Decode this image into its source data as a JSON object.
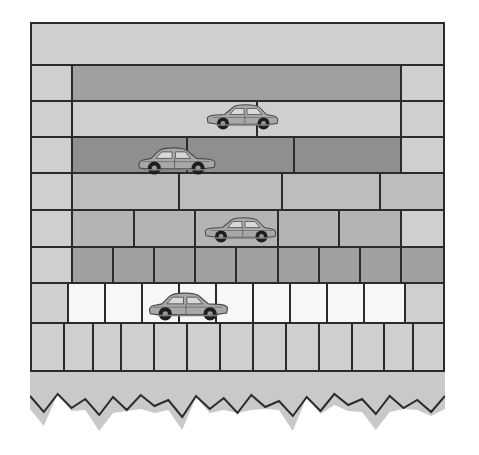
{
  "figure": {
    "kind": "diagram",
    "frame": {
      "border_color": "#2b2b2b",
      "background_color": "#c9c9c9",
      "x": 30,
      "y": 22,
      "width": 415,
      "height": 350
    }
  },
  "palette": {
    "outline": "#2b2b2b",
    "lightest": "#f7f7f7",
    "light": "#cfcfcf",
    "mid": "#bdbdbd",
    "mid2": "#b4b4b4",
    "dark": "#a0a0a0",
    "darker": "#8f8f8f",
    "rubble_fill": "#c9c9c9",
    "car_body": "#a8a8a8",
    "car_wheel": "#222222"
  },
  "wall": {
    "description": "Nine horizontal courses of masonry; brick count increases downward while brick size decreases.",
    "rows": [
      {
        "index": 1,
        "name": "course-1-capping",
        "height_px": 42,
        "tone": "light",
        "brick_count": 1,
        "bricks": [
          {
            "width_pct": 100,
            "tone": "light"
          }
        ]
      },
      {
        "index": 2,
        "name": "course-2",
        "height_px": 36,
        "tone": "dark",
        "brick_count": 3,
        "bricks": [
          {
            "width_pct": 10,
            "tone": "light"
          },
          {
            "width_pct": 80,
            "tone": "dark"
          },
          {
            "width_pct": 10,
            "tone": "light"
          }
        ]
      },
      {
        "index": 3,
        "name": "course-3",
        "height_px": 36,
        "tone": "light",
        "brick_count": 4,
        "bricks": [
          {
            "width_pct": 10,
            "tone": "light"
          },
          {
            "width_pct": 45,
            "tone": "light"
          },
          {
            "width_pct": 35,
            "tone": "light"
          },
          {
            "width_pct": 10,
            "tone": "light"
          }
        ]
      },
      {
        "index": 4,
        "name": "course-4",
        "height_px": 36,
        "tone": "darker",
        "brick_count": 5,
        "bricks": [
          {
            "width_pct": 10,
            "tone": "light"
          },
          {
            "width_pct": 28,
            "tone": "darker"
          },
          {
            "width_pct": 26,
            "tone": "darker"
          },
          {
            "width_pct": 26,
            "tone": "darker"
          },
          {
            "width_pct": 10,
            "tone": "light"
          }
        ]
      },
      {
        "index": 5,
        "name": "course-5",
        "height_px": 37,
        "tone": "mid",
        "brick_count": 5,
        "bricks": [
          {
            "width_pct": 10,
            "tone": "light"
          },
          {
            "width_pct": 26,
            "tone": "mid"
          },
          {
            "width_pct": 25,
            "tone": "mid"
          },
          {
            "width_pct": 24,
            "tone": "mid"
          },
          {
            "width_pct": 15,
            "tone": "mid"
          }
        ]
      },
      {
        "index": 6,
        "name": "course-6",
        "height_px": 37,
        "tone": "mid2",
        "brick_count": 7,
        "bricks": [
          {
            "width_pct": 10,
            "tone": "light"
          },
          {
            "width_pct": 15,
            "tone": "mid2"
          },
          {
            "width_pct": 15,
            "tone": "mid2"
          },
          {
            "width_pct": 20,
            "tone": "mid2"
          },
          {
            "width_pct": 15,
            "tone": "mid2"
          },
          {
            "width_pct": 15,
            "tone": "mid2"
          },
          {
            "width_pct": 10,
            "tone": "light"
          }
        ]
      },
      {
        "index": 7,
        "name": "course-7",
        "height_px": 36,
        "tone": "dark",
        "brick_count": 10,
        "bricks": [
          {
            "width_pct": 10,
            "tone": "light"
          },
          {
            "width_pct": 10,
            "tone": "dark"
          },
          {
            "width_pct": 10,
            "tone": "dark"
          },
          {
            "width_pct": 10,
            "tone": "dark"
          },
          {
            "width_pct": 10,
            "tone": "dark"
          },
          {
            "width_pct": 10,
            "tone": "dark"
          },
          {
            "width_pct": 10,
            "tone": "dark"
          },
          {
            "width_pct": 10,
            "tone": "dark"
          },
          {
            "width_pct": 10,
            "tone": "dark"
          },
          {
            "width_pct": 10,
            "tone": "dark"
          }
        ]
      },
      {
        "index": 8,
        "name": "course-8-white",
        "height_px": 40,
        "tone": "lightest",
        "brick_count": 11,
        "bricks": [
          {
            "width_pct": 9,
            "tone": "light"
          },
          {
            "width_pct": 9,
            "tone": "lightest"
          },
          {
            "width_pct": 9,
            "tone": "lightest"
          },
          {
            "width_pct": 9,
            "tone": "lightest"
          },
          {
            "width_pct": 9,
            "tone": "lightest"
          },
          {
            "width_pct": 9,
            "tone": "lightest"
          },
          {
            "width_pct": 9,
            "tone": "lightest"
          },
          {
            "width_pct": 9,
            "tone": "lightest"
          },
          {
            "width_pct": 9,
            "tone": "lightest"
          },
          {
            "width_pct": 10,
            "tone": "lightest"
          },
          {
            "width_pct": 9,
            "tone": "light"
          }
        ]
      },
      {
        "index": 9,
        "name": "course-9-base",
        "height_px": 46,
        "tone": "light",
        "brick_count": 13,
        "bricks": [
          {
            "width_pct": 8,
            "tone": "light"
          },
          {
            "width_pct": 7,
            "tone": "light"
          },
          {
            "width_pct": 7,
            "tone": "light"
          },
          {
            "width_pct": 8,
            "tone": "light"
          },
          {
            "width_pct": 8,
            "tone": "light"
          },
          {
            "width_pct": 8,
            "tone": "light"
          },
          {
            "width_pct": 8,
            "tone": "light"
          },
          {
            "width_pct": 8,
            "tone": "light"
          },
          {
            "width_pct": 8,
            "tone": "light"
          },
          {
            "width_pct": 8,
            "tone": "light"
          },
          {
            "width_pct": 8,
            "tone": "light"
          },
          {
            "width_pct": 7,
            "tone": "light"
          },
          {
            "width_pct": 7,
            "tone": "light"
          }
        ]
      }
    ]
  },
  "cars": [
    {
      "id": 1,
      "name": "car-sedan-1",
      "facing": "right",
      "x": 205,
      "y": 100,
      "width": 75,
      "row": 3
    },
    {
      "id": 2,
      "name": "car-sedan-2",
      "facing": "left",
      "x": 136,
      "y": 143,
      "width": 82,
      "row": 4
    },
    {
      "id": 3,
      "name": "car-sedan-3",
      "facing": "right",
      "x": 203,
      "y": 213,
      "width": 75,
      "row": 6
    },
    {
      "id": 4,
      "name": "car-sedan-4",
      "facing": "left",
      "x": 147,
      "y": 288,
      "width": 83,
      "row": 8
    }
  ],
  "rubble": {
    "name": "jagged-broken-base",
    "description": "Irregular zig-zag line representing broken / uneven ground at the base of the wall.",
    "fill": "#c9c9c9",
    "stroke": "#2b2b2b",
    "peak_count": 30
  }
}
